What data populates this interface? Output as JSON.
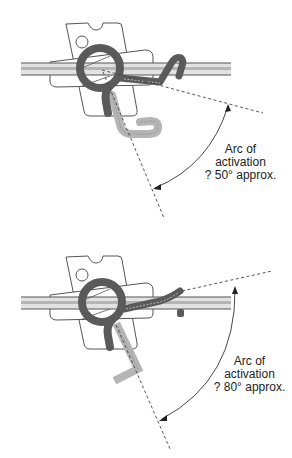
{
  "diagrams": [
    {
      "id": "top",
      "label": {
        "line1": "Arc of",
        "line2": "activation",
        "line3": "? 50° approx."
      },
      "angle_degrees": 50
    },
    {
      "id": "bottom",
      "label": {
        "line1": "Arc of",
        "line2": "activation",
        "line3": "? 80° approx."
      },
      "angle_degrees": 80
    }
  ],
  "colors": {
    "rod_outline": "#555555",
    "rod_fill": "#d8d8d8",
    "spring_dark": "#5a5a5a",
    "spring_light": "#b8b8b8",
    "plate_stroke": "#555555",
    "dashed": "#444444",
    "text": "#222222"
  }
}
